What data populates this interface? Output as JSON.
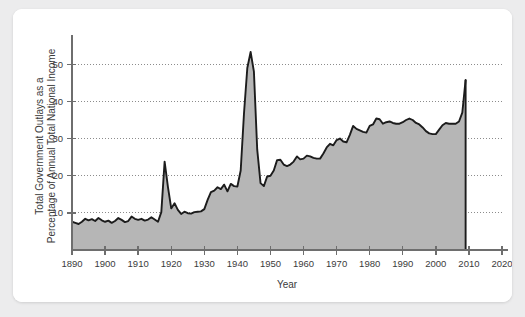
{
  "figure": {
    "background_color": "#ffffff",
    "page_background_color": "#ececed",
    "area_fill_color": "#b6b6b6",
    "line_color": "#1c1c1c",
    "axis_color": "#6e6e6e",
    "grid_color": "#8c8c8c",
    "text_color": "#3b3b3b"
  },
  "chart_data": {
    "type": "area",
    "title": "",
    "xlabel": "Year",
    "ylabel_line1": "Total Government Outlays as a",
    "ylabel_line2": "Percentage of Annual Total National Income",
    "ylabel": "Total Government Outlays as a Percentage of Annual Total National Income",
    "xlim": [
      1890,
      2020
    ],
    "ylim": [
      0,
      56
    ],
    "xticks": [
      1890,
      1900,
      1910,
      1920,
      1930,
      1940,
      1950,
      1960,
      1970,
      1980,
      1990,
      2000,
      2010,
      2020
    ],
    "xtick_labels": [
      "1890",
      "1900",
      "1910",
      "1920",
      "1930",
      "1940",
      "1950",
      "1960",
      "1970",
      "1980",
      "1990",
      "2000",
      "2010",
      "2020"
    ],
    "yticks": [
      10,
      20,
      30,
      40,
      50
    ],
    "ytick_labels": [
      "10",
      "20",
      "30",
      "40",
      "50"
    ],
    "grid": "horizontal-dotted",
    "legend": "none",
    "series_name": "Total Government Outlays",
    "x": [
      1890,
      1891,
      1892,
      1893,
      1894,
      1895,
      1896,
      1897,
      1898,
      1899,
      1900,
      1901,
      1902,
      1903,
      1904,
      1905,
      1906,
      1907,
      1908,
      1909,
      1910,
      1911,
      1912,
      1913,
      1914,
      1915,
      1916,
      1917,
      1918,
      1919,
      1920,
      1921,
      1922,
      1923,
      1924,
      1925,
      1926,
      1927,
      1928,
      1929,
      1930,
      1931,
      1932,
      1933,
      1934,
      1935,
      1936,
      1937,
      1938,
      1939,
      1940,
      1941,
      1942,
      1943,
      1944,
      1945,
      1946,
      1947,
      1948,
      1949,
      1950,
      1951,
      1952,
      1953,
      1954,
      1955,
      1956,
      1957,
      1958,
      1959,
      1960,
      1961,
      1962,
      1963,
      1964,
      1965,
      1966,
      1967,
      1968,
      1969,
      1970,
      1971,
      1972,
      1973,
      1974,
      1975,
      1976,
      1977,
      1978,
      1979,
      1980,
      1981,
      1982,
      1983,
      1984,
      1985,
      1986,
      1987,
      1988,
      1989,
      1990,
      1991,
      1992,
      1993,
      1994,
      1995,
      1996,
      1997,
      1998,
      1999,
      2000,
      2001,
      2002,
      2003,
      2004,
      2005,
      2006,
      2007,
      2008,
      2009
    ],
    "values": [
      7.6,
      7.3,
      7.0,
      7.6,
      8.4,
      8.0,
      8.3,
      7.8,
      8.6,
      8.0,
      7.6,
      7.9,
      7.3,
      7.8,
      8.6,
      8.1,
      7.5,
      7.8,
      9.0,
      8.4,
      8.1,
      8.4,
      7.9,
      8.2,
      8.8,
      8.2,
      7.6,
      10.2,
      23.8,
      17.0,
      11.2,
      12.6,
      10.8,
      9.7,
      10.3,
      9.9,
      9.8,
      10.2,
      10.3,
      10.4,
      11.0,
      13.5,
      15.6,
      16.0,
      16.9,
      16.4,
      17.6,
      15.8,
      17.8,
      17.2,
      17.1,
      21.4,
      36.8,
      49.0,
      53.3,
      48.0,
      27.0,
      18.0,
      17.2,
      19.8,
      20.0,
      21.4,
      24.2,
      24.3,
      23.0,
      22.6,
      23.0,
      23.8,
      25.2,
      24.4,
      24.6,
      25.4,
      25.2,
      24.8,
      24.6,
      24.6,
      26.0,
      27.6,
      28.6,
      28.2,
      29.6,
      30.0,
      29.2,
      29.0,
      31.0,
      33.4,
      32.6,
      32.2,
      31.8,
      31.6,
      33.4,
      33.8,
      35.4,
      35.2,
      34.0,
      34.4,
      34.6,
      34.2,
      34.0,
      34.0,
      34.4,
      35.0,
      35.4,
      35.0,
      34.2,
      33.8,
      33.0,
      32.0,
      31.4,
      31.2,
      31.2,
      32.4,
      33.6,
      34.2,
      34.0,
      34.0,
      34.0,
      34.6,
      37.0,
      45.8
    ]
  }
}
